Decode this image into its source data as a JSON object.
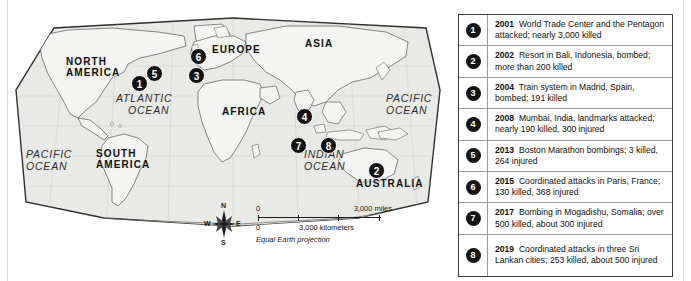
{
  "map": {
    "projection_note": "Equal Earth projection",
    "continent_labels": [
      {
        "name": "north-america",
        "text": "NORTH\nAMERICA",
        "line1": "NORTH",
        "line2": "AMERICA",
        "x": 58,
        "y": 57
      },
      {
        "name": "south-america",
        "text": "SOUTH\nAMERICA",
        "line1": "SOUTH",
        "line2": "AMERICA",
        "x": 88,
        "y": 148
      },
      {
        "name": "europe",
        "text": "EUROPE",
        "x": 204,
        "y": 44
      },
      {
        "name": "asia",
        "text": "ASIA",
        "x": 297,
        "y": 38
      },
      {
        "name": "africa",
        "text": "AFRICA",
        "x": 214,
        "y": 104
      },
      {
        "name": "australia",
        "text": "AUSTRALIA",
        "x": 350,
        "y": 175
      }
    ],
    "ocean_labels": [
      {
        "name": "atlantic-ocean",
        "line1": "ATLANTIC",
        "line2": "OCEAN",
        "x": 108,
        "y": 92
      },
      {
        "name": "pacific-ocean-west",
        "line1": "PACIFIC",
        "line2": "OCEAN",
        "x": 18,
        "y": 148
      },
      {
        "name": "pacific-ocean-east",
        "line1": "PACIFIC",
        "line2": "OCEAN",
        "x": 378,
        "y": 92
      },
      {
        "name": "indian-ocean",
        "line1": "INDIAN",
        "line2": "OCEAN",
        "x": 296,
        "y": 148
      }
    ],
    "markers": [
      {
        "label": "1",
        "x": 123,
        "y": 69
      },
      {
        "label": "5",
        "x": 138,
        "y": 59
      },
      {
        "label": "6",
        "x": 182,
        "y": 42
      },
      {
        "label": "3",
        "x": 180,
        "y": 61
      },
      {
        "label": "4",
        "x": 288,
        "y": 102
      },
      {
        "label": "7",
        "x": 282,
        "y": 131
      },
      {
        "label": "8",
        "x": 312,
        "y": 131
      },
      {
        "label": "2",
        "x": 360,
        "y": 156
      }
    ],
    "scale": {
      "zero_top": "0",
      "zero_bottom": "0",
      "miles_label": "3,000 miles",
      "kilometers_label": "3,000 kilometers",
      "projection": "Equal Earth projection"
    },
    "compass": {
      "north": "N",
      "south": "S",
      "west": "W",
      "east": "E"
    }
  },
  "legend": {
    "rows": [
      {
        "number": "1",
        "year": "2001",
        "description": "World Trade Center and the Pentagon attacked; nearly 3,000 killed"
      },
      {
        "number": "2",
        "year": "2002",
        "description": "Resort in Bali, Indonesia, bombed; more than 200 killed"
      },
      {
        "number": "3",
        "year": "2004",
        "description": "Train system in Madrid, Spain, bombed; 191 killed"
      },
      {
        "number": "4",
        "year": "2008",
        "description": "Mumbai, India, landmarks attacked; nearly 190 killed, 300 injured"
      },
      {
        "number": "5",
        "year": "2013",
        "description": "Boston Marathon bombings; 3 killed, 264 injured"
      },
      {
        "number": "6",
        "year": "2015",
        "description": "Coordinated attacks in Paris, France; 130 killed, 368 injured"
      },
      {
        "number": "7",
        "year": "2017",
        "description": "Bombing in Mogadishu, Somalia; over 500 killed, about 300 injured"
      },
      {
        "number": "8",
        "year": "2019",
        "description": "Coordinated attacks in three Sri Lankan cities; 253 killed, about 500 injured"
      }
    ]
  },
  "colors": {
    "marker_fill": "#141414",
    "marker_text": "#ffffff",
    "map_water": "#e9e9e6",
    "map_line": "#6e6e6e",
    "legend_border": "#3a3a3a"
  }
}
